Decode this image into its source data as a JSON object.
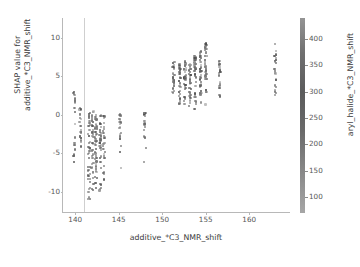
{
  "chart_data": {
    "type": "scatter",
    "title": "",
    "xlabel": "additive_*C3_NMR_shift",
    "ylabel": "SHAP value for\nadditive_*C3_NMR_shift",
    "ylabel_line1": "SHAP value for",
    "ylabel_line2": "additive_*C3_NMR_shift",
    "xlim": [
      138.6,
      164.8
    ],
    "ylim": [
      -12.8,
      12.6
    ],
    "xticks": [
      140,
      145,
      150,
      155,
      160
    ],
    "xticklabels": [
      "140",
      "145",
      "150",
      "155",
      "160"
    ],
    "yticks": [
      10,
      5,
      0,
      -5,
      -10
    ],
    "yticklabels": [
      "10",
      "5",
      "0",
      "-5",
      "-10"
    ],
    "grid": false,
    "legend": false,
    "marker": "circle",
    "marker_size": 2.2,
    "point_color": "#6b6b6b",
    "reference_line_x": 141.05,
    "reference_line_color": "#cfcfcf",
    "colorbar": {
      "label": "aryl_halide_*C3_NMR_shift",
      "ticks": [
        100,
        150,
        200,
        250,
        300,
        350,
        400
      ],
      "ticklabels": [
        "100",
        "150",
        "200",
        "250",
        "300",
        "350",
        "400"
      ],
      "vmin": 70,
      "vmax": 440,
      "orientation": "vertical",
      "colormap": "grayscale"
    },
    "clusters": [
      {
        "x": 139.9,
        "y_min": -9.2,
        "y_max": 3.6,
        "n": 26
      },
      {
        "x": 140.6,
        "y_min": -6.2,
        "y_max": 1.1,
        "n": 22
      },
      {
        "x": 141.6,
        "y_min": -12.1,
        "y_max": 0.4,
        "n": 46
      },
      {
        "x": 142.0,
        "y_min": -10.2,
        "y_max": 0.5,
        "n": 40
      },
      {
        "x": 142.4,
        "y_min": -11.0,
        "y_max": 0.3,
        "n": 42
      },
      {
        "x": 142.9,
        "y_min": -10.6,
        "y_max": 0.2,
        "n": 38
      },
      {
        "x": 143.3,
        "y_min": -9.4,
        "y_max": 0.1,
        "n": 30
      },
      {
        "x": 145.2,
        "y_min": -7.9,
        "y_max": 0.3,
        "n": 24
      },
      {
        "x": 148.0,
        "y_min": -6.6,
        "y_max": 0.2,
        "n": 20
      },
      {
        "x": 151.3,
        "y_min": 1.6,
        "y_max": 7.2,
        "n": 32
      },
      {
        "x": 152.0,
        "y_min": 1.2,
        "y_max": 6.6,
        "n": 34
      },
      {
        "x": 152.6,
        "y_min": 0.9,
        "y_max": 7.0,
        "n": 36
      },
      {
        "x": 153.2,
        "y_min": 1.0,
        "y_max": 6.9,
        "n": 40
      },
      {
        "x": 153.8,
        "y_min": 0.6,
        "y_max": 7.6,
        "n": 44
      },
      {
        "x": 154.4,
        "y_min": 0.8,
        "y_max": 8.4,
        "n": 42
      },
      {
        "x": 155.0,
        "y_min": 1.0,
        "y_max": 9.4,
        "n": 38
      },
      {
        "x": 156.6,
        "y_min": 2.2,
        "y_max": 7.1,
        "n": 22
      },
      {
        "x": 163.0,
        "y_min": 2.4,
        "y_max": 9.6,
        "n": 26
      }
    ],
    "n_points_total": 602
  }
}
